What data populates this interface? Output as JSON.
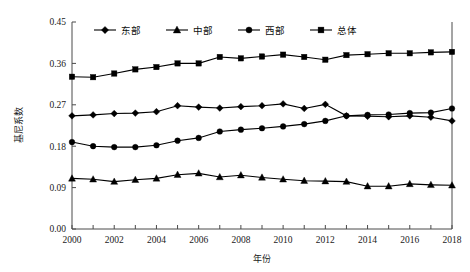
{
  "chart_data": {
    "type": "line",
    "title": "",
    "xlabel": "年份",
    "ylabel": "基尼系数",
    "x": [
      2000,
      2001,
      2002,
      2003,
      2004,
      2005,
      2006,
      2007,
      2008,
      2009,
      2010,
      2011,
      2012,
      2013,
      2014,
      2015,
      2016,
      2017,
      2018
    ],
    "xlim": [
      2000,
      2018
    ],
    "ylim": [
      0.0,
      0.45
    ],
    "yticks": [
      0.0,
      0.09,
      0.18,
      0.27,
      0.36,
      0.45
    ],
    "ytick_labels": [
      "0.00",
      "0.09",
      "0.18",
      "0.27",
      "0.36",
      "0.45"
    ],
    "xticks": [
      2000,
      2002,
      2004,
      2006,
      2008,
      2010,
      2012,
      2014,
      2016,
      2018
    ],
    "xtick_labels": [
      "2000",
      "2002",
      "2004",
      "2006",
      "2008",
      "2010",
      "2012",
      "2014",
      "2016",
      "2018"
    ],
    "grid": false,
    "legend_position": "top-center",
    "series": [
      {
        "name": "东部",
        "marker": "diamond",
        "color": "#000000",
        "values": [
          0.246,
          0.248,
          0.251,
          0.252,
          0.255,
          0.268,
          0.265,
          0.263,
          0.266,
          0.268,
          0.272,
          0.262,
          0.271,
          0.246,
          0.245,
          0.244,
          0.246,
          0.243,
          0.235
        ]
      },
      {
        "name": "中部",
        "marker": "triangle",
        "color": "#000000",
        "values": [
          0.11,
          0.108,
          0.103,
          0.107,
          0.11,
          0.118,
          0.121,
          0.113,
          0.117,
          0.112,
          0.108,
          0.105,
          0.104,
          0.103,
          0.093,
          0.093,
          0.098,
          0.096,
          0.095
        ]
      },
      {
        "name": "西部",
        "marker": "circle",
        "color": "#000000",
        "values": [
          0.189,
          0.18,
          0.178,
          0.178,
          0.182,
          0.192,
          0.198,
          0.212,
          0.216,
          0.219,
          0.223,
          0.228,
          0.235,
          0.246,
          0.248,
          0.249,
          0.252,
          0.253,
          0.262
        ]
      },
      {
        "name": "总体",
        "marker": "square",
        "color": "#000000",
        "values": [
          0.331,
          0.33,
          0.338,
          0.347,
          0.352,
          0.36,
          0.36,
          0.374,
          0.371,
          0.375,
          0.379,
          0.374,
          0.368,
          0.378,
          0.38,
          0.382,
          0.382,
          0.384,
          0.385
        ]
      }
    ]
  },
  "legend": {
    "items": [
      {
        "label": "东部",
        "marker": "diamond"
      },
      {
        "label": "中部",
        "marker": "triangle"
      },
      {
        "label": "西部",
        "marker": "circle"
      },
      {
        "label": "总体",
        "marker": "square"
      }
    ]
  },
  "axes": {
    "y_title": "基尼系数",
    "x_title": "年份"
  }
}
